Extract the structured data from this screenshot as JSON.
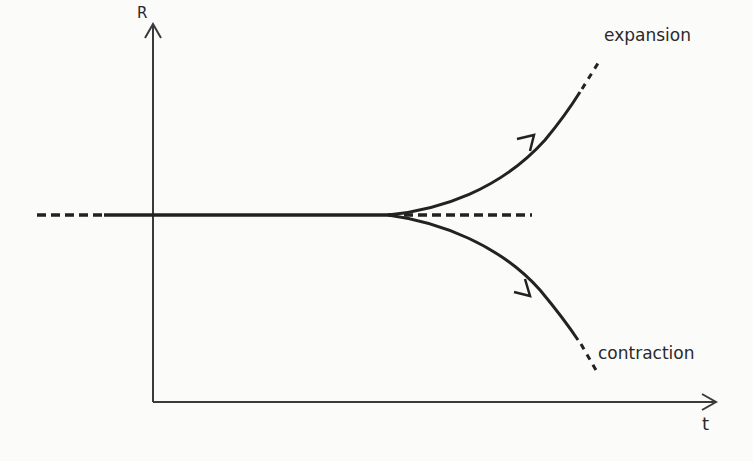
{
  "diagram": {
    "axes": {
      "y_label": "R",
      "x_label": "t"
    },
    "branches": [
      {
        "label": "expansion",
        "direction": "up"
      },
      {
        "label": "contraction",
        "direction": "down"
      }
    ],
    "colors": {
      "line": "#222222",
      "axis": "#3a3a3a",
      "background": "#fbfbfa"
    }
  }
}
